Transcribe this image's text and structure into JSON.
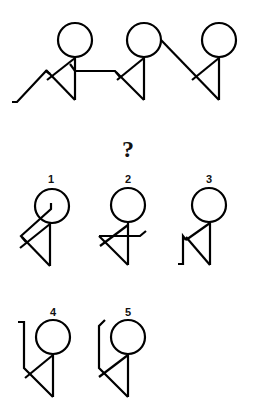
{
  "puzzle": {
    "question_mark": "?",
    "sequence": [
      {
        "id": "seq-1",
        "description": "stick figure with left arm zigzag down, right arm horizontal"
      },
      {
        "id": "seq-2",
        "description": "stick figure holding hand from left figure"
      },
      {
        "id": "seq-3",
        "description": "stick figure holding diagonal line from middle figure"
      }
    ],
    "options": [
      {
        "label": "1"
      },
      {
        "label": "2"
      },
      {
        "label": "3"
      },
      {
        "label": "4"
      },
      {
        "label": "5"
      }
    ]
  },
  "colors": {
    "stroke": "#000000",
    "background": "#ffffff"
  }
}
